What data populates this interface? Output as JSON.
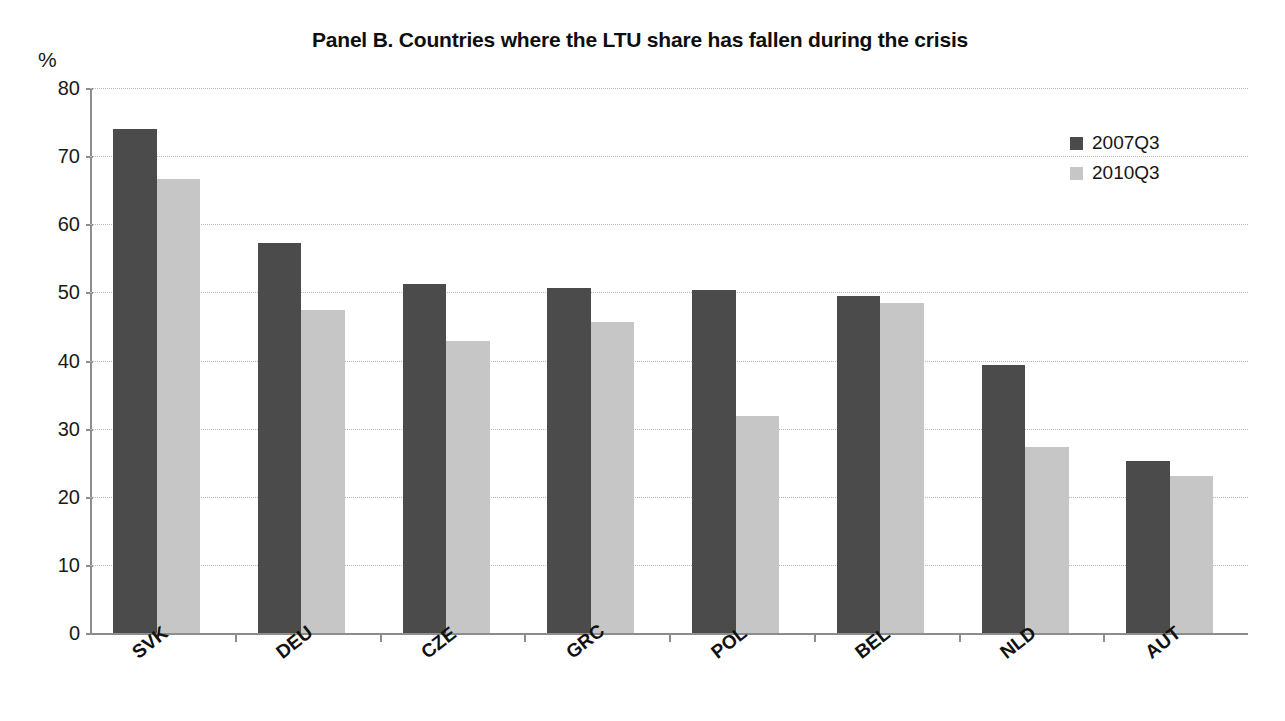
{
  "chart_data": {
    "type": "bar",
    "title": "Panel B. Countries where the LTU share has fallen during the crisis",
    "xlabel": "",
    "ylabel": "%",
    "ylim": [
      0,
      80
    ],
    "yticks": [
      0,
      10,
      20,
      30,
      40,
      50,
      60,
      70,
      80
    ],
    "ytick_labels": [
      "0",
      "10",
      "20",
      "30",
      "40",
      "50",
      "60",
      "70",
      "80"
    ],
    "grid": true,
    "legend_position": "top-right",
    "categories": [
      "SVK",
      "DEU",
      "CZE",
      "GRC",
      "POL",
      "BEL",
      "NLD",
      "AUT"
    ],
    "series": [
      {
        "name": "2007Q3",
        "color": "#4b4b4b",
        "values": [
          74.0,
          57.3,
          51.3,
          50.6,
          50.3,
          49.4,
          39.4,
          25.3
        ]
      },
      {
        "name": "2010Q3",
        "color": "#c6c6c6",
        "values": [
          66.6,
          47.4,
          42.8,
          45.7,
          31.8,
          48.4,
          27.3,
          23.1
        ]
      }
    ]
  },
  "legend": {
    "entries": [
      {
        "label": "2007Q3",
        "swatch": "series-0"
      },
      {
        "label": "2010Q3",
        "swatch": "series-1"
      }
    ]
  },
  "colors": {
    "series_2007q3": "#4b4b4b",
    "series_2010q3": "#c6c6c6",
    "axis": "#8d8d8d",
    "gridline": "#b9b9b9",
    "text": "#111111",
    "background": "#ffffff"
  }
}
